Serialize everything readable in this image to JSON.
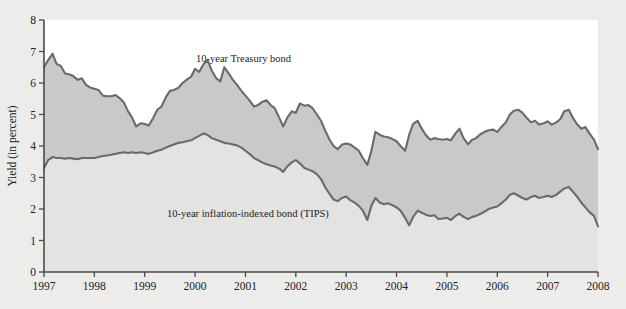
{
  "figure": {
    "background_color": "#ececea",
    "plot_background_color": "#ffffff",
    "band_color": "#c9c9c7",
    "under_color": "#e3e3e1",
    "line_color": "#6a6a6a"
  },
  "labels": {
    "treasury": "10-year Treasury bond",
    "tips": "10-year inflation-indexed bond (TIPS)",
    "ylabel": "Yield (in percent)",
    "source_note": ""
  },
  "chart_data": {
    "type": "line",
    "title": "",
    "xlabel": "",
    "ylabel": "Yield (in percent)",
    "xlim": [
      1997,
      2008
    ],
    "ylim": [
      0,
      8
    ],
    "xticks": [
      "1997",
      "1998",
      "1999",
      "2000",
      "2001",
      "2002",
      "2003",
      "2004",
      "2005",
      "2006",
      "2007",
      "2008"
    ],
    "yticks": [
      "0",
      "1",
      "2",
      "3",
      "4",
      "5",
      "6",
      "7",
      "8"
    ],
    "grid": false,
    "legend": "inline-annotations",
    "fill_between": true,
    "x": [
      1997.0,
      1997.08,
      1997.17,
      1997.25,
      1997.33,
      1997.42,
      1997.5,
      1997.58,
      1997.67,
      1997.75,
      1997.83,
      1997.92,
      1998.0,
      1998.08,
      1998.17,
      1998.25,
      1998.33,
      1998.42,
      1998.5,
      1998.58,
      1998.67,
      1998.75,
      1998.83,
      1998.92,
      1999.0,
      1999.08,
      1999.17,
      1999.25,
      1999.33,
      1999.42,
      1999.5,
      1999.58,
      1999.67,
      1999.75,
      1999.83,
      1999.92,
      2000.0,
      2000.08,
      2000.17,
      2000.25,
      2000.33,
      2000.42,
      2000.5,
      2000.58,
      2000.67,
      2000.75,
      2000.83,
      2000.92,
      2001.0,
      2001.08,
      2001.17,
      2001.25,
      2001.33,
      2001.42,
      2001.5,
      2001.58,
      2001.67,
      2001.75,
      2001.83,
      2001.92,
      2002.0,
      2002.08,
      2002.17,
      2002.25,
      2002.33,
      2002.42,
      2002.5,
      2002.58,
      2002.67,
      2002.75,
      2002.83,
      2002.92,
      2003.0,
      2003.08,
      2003.17,
      2003.25,
      2003.33,
      2003.42,
      2003.5,
      2003.58,
      2003.67,
      2003.75,
      2003.83,
      2003.92,
      2004.0,
      2004.08,
      2004.17,
      2004.25,
      2004.33,
      2004.42,
      2004.5,
      2004.58,
      2004.67,
      2004.75,
      2004.83,
      2004.92,
      2005.0,
      2005.08,
      2005.17,
      2005.25,
      2005.33,
      2005.42,
      2005.5,
      2005.58,
      2005.67,
      2005.75,
      2005.83,
      2005.92,
      2006.0,
      2006.08,
      2006.17,
      2006.25,
      2006.33,
      2006.42,
      2006.5,
      2006.58,
      2006.67,
      2006.75,
      2006.83,
      2006.92,
      2007.0,
      2007.08,
      2007.17,
      2007.25,
      2007.33,
      2007.42,
      2007.5,
      2007.58,
      2007.67,
      2007.75,
      2007.83,
      2007.92,
      2008.0
    ],
    "series": [
      {
        "name": "10-year Treasury bond",
        "values": [
          6.5,
          6.72,
          6.93,
          6.6,
          6.55,
          6.3,
          6.28,
          6.22,
          6.1,
          6.15,
          5.95,
          5.85,
          5.82,
          5.78,
          5.6,
          5.58,
          5.58,
          5.62,
          5.52,
          5.4,
          5.1,
          4.9,
          4.62,
          4.72,
          4.7,
          4.65,
          4.9,
          5.15,
          5.25,
          5.55,
          5.75,
          5.78,
          5.85,
          6.0,
          6.1,
          6.2,
          6.45,
          6.35,
          6.6,
          6.72,
          6.4,
          6.15,
          6.05,
          6.5,
          6.3,
          6.1,
          5.95,
          5.75,
          5.6,
          5.45,
          5.25,
          5.3,
          5.4,
          5.45,
          5.3,
          5.2,
          4.9,
          4.62,
          4.9,
          5.1,
          5.05,
          5.35,
          5.28,
          5.3,
          5.2,
          5.0,
          4.8,
          4.5,
          4.2,
          4.0,
          3.9,
          4.05,
          4.08,
          4.05,
          3.95,
          3.85,
          3.62,
          3.4,
          3.85,
          4.45,
          4.35,
          4.3,
          4.28,
          4.22,
          4.15,
          4.0,
          3.85,
          4.35,
          4.7,
          4.8,
          4.55,
          4.35,
          4.2,
          4.25,
          4.22,
          4.2,
          4.22,
          4.18,
          4.4,
          4.55,
          4.25,
          4.05,
          4.2,
          4.25,
          4.38,
          4.45,
          4.5,
          4.52,
          4.45,
          4.6,
          4.75,
          5.0,
          5.12,
          5.15,
          5.05,
          4.9,
          4.75,
          4.8,
          4.68,
          4.72,
          4.78,
          4.68,
          4.75,
          4.85,
          5.1,
          5.15,
          4.9,
          4.7,
          4.55,
          4.6,
          4.4,
          4.2,
          3.9
        ]
      },
      {
        "name": "10-year inflation-indexed bond (TIPS)",
        "values": [
          3.3,
          3.55,
          3.65,
          3.62,
          3.62,
          3.6,
          3.62,
          3.6,
          3.58,
          3.62,
          3.62,
          3.62,
          3.62,
          3.65,
          3.68,
          3.7,
          3.72,
          3.75,
          3.78,
          3.8,
          3.78,
          3.8,
          3.78,
          3.8,
          3.78,
          3.75,
          3.8,
          3.85,
          3.88,
          3.95,
          4.0,
          4.05,
          4.1,
          4.12,
          4.15,
          4.18,
          4.25,
          4.32,
          4.4,
          4.35,
          4.25,
          4.2,
          4.15,
          4.1,
          4.08,
          4.05,
          4.02,
          3.95,
          3.85,
          3.75,
          3.62,
          3.55,
          3.48,
          3.42,
          3.38,
          3.35,
          3.28,
          3.18,
          3.35,
          3.48,
          3.55,
          3.45,
          3.3,
          3.25,
          3.2,
          3.1,
          2.95,
          2.7,
          2.48,
          2.3,
          2.25,
          2.35,
          2.4,
          2.28,
          2.2,
          2.1,
          1.95,
          1.65,
          2.1,
          2.35,
          2.2,
          2.15,
          2.18,
          2.12,
          2.05,
          1.95,
          1.72,
          1.48,
          1.75,
          1.95,
          1.88,
          1.82,
          1.78,
          1.8,
          1.68,
          1.7,
          1.72,
          1.65,
          1.78,
          1.85,
          1.75,
          1.68,
          1.75,
          1.78,
          1.85,
          1.92,
          2.0,
          2.05,
          2.08,
          2.18,
          2.3,
          2.45,
          2.5,
          2.42,
          2.35,
          2.3,
          2.38,
          2.42,
          2.35,
          2.38,
          2.42,
          2.38,
          2.45,
          2.55,
          2.65,
          2.7,
          2.55,
          2.4,
          2.2,
          2.05,
          1.9,
          1.78,
          1.45
        ]
      }
    ]
  }
}
